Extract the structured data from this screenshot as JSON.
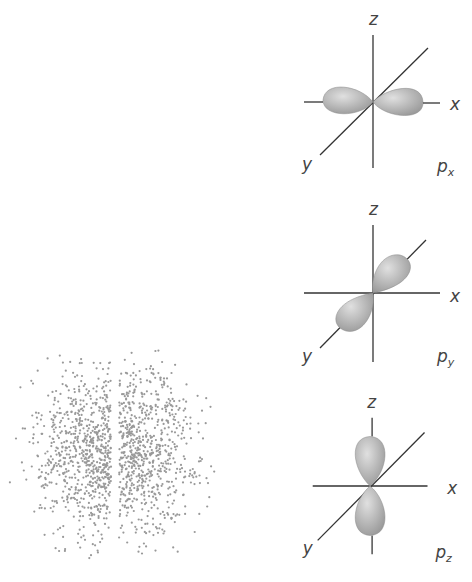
{
  "figure": {
    "electron_cloud": {
      "description": "p orbital electron density dot plot",
      "dot_color": "#999999"
    },
    "panels": [
      {
        "id": "px",
        "axes": {
          "z": "z",
          "x": "x",
          "y": "y"
        },
        "label_main": "p",
        "label_sub": "x",
        "lobe_axis": "x"
      },
      {
        "id": "py",
        "axes": {
          "z": "z",
          "x": "x",
          "y": "y"
        },
        "label_main": "p",
        "label_sub": "y",
        "lobe_axis": "y"
      },
      {
        "id": "pz",
        "axes": {
          "z": "z",
          "x": "x",
          "y": "y"
        },
        "label_main": "p",
        "label_sub": "z",
        "lobe_axis": "z"
      }
    ],
    "colors": {
      "lobe": "#b8b8b8",
      "lobe_highlight": "#dcdcdc",
      "axis": "#333333",
      "label": "#444444"
    }
  }
}
